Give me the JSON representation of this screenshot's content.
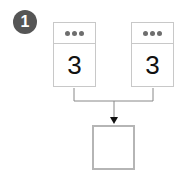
{
  "step_badge": {
    "label": "1",
    "color": "#555555"
  },
  "cards": [
    {
      "menu_icon": "more-dots-icon",
      "value": "3"
    },
    {
      "menu_icon": "more-dots-icon",
      "value": "3"
    }
  ],
  "connector": {
    "type": "merge-arrow",
    "direction": "down",
    "color": "#888888"
  },
  "target_box": {
    "content": ""
  }
}
